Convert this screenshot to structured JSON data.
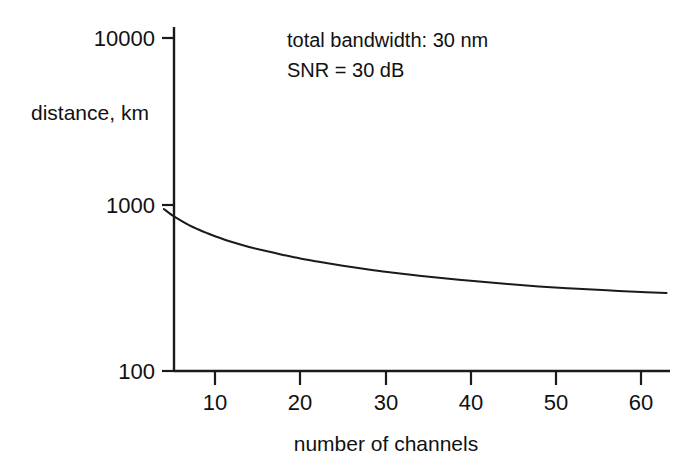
{
  "figure": {
    "background_color": "#ffffff",
    "line_color": "#1a1a1a",
    "axis_color": "#1a1a1a"
  },
  "annotations": {
    "line1": "total bandwidth: 30 nm",
    "line2": "SNR = 30 dB"
  },
  "axis_titles": {
    "y": "distance, km",
    "x": "number of channels"
  },
  "yticks": [
    {
      "label": "100",
      "value": 100
    },
    {
      "label": "1000",
      "value": 1000
    },
    {
      "label": "10000",
      "value": 10000
    }
  ],
  "xticks": [
    {
      "label": "10",
      "value": 10
    },
    {
      "label": "20",
      "value": 20
    },
    {
      "label": "30",
      "value": 30
    },
    {
      "label": "40",
      "value": 40
    },
    {
      "label": "50",
      "value": 50
    },
    {
      "label": "60",
      "value": 60
    }
  ],
  "chart_data": {
    "type": "line",
    "title": "",
    "subtitle": "",
    "xlabel": "number of channels",
    "ylabel": "distance, km",
    "xscale": "linear",
    "yscale": "log",
    "xlim": [
      4,
      63
    ],
    "ylim": [
      100,
      10000
    ],
    "grid": false,
    "legend": null,
    "annotations": [
      "total bandwidth: 30 nm",
      "SNR = 30 dB"
    ],
    "series": [
      {
        "name": "transmission distance vs number of channels",
        "x": [
          4,
          5,
          6,
          7,
          8,
          9,
          10,
          12,
          14,
          16,
          18,
          20,
          22,
          25,
          28,
          30,
          33,
          36,
          40,
          44,
          48,
          52,
          56,
          60,
          63
        ],
        "y": [
          940,
          860,
          800,
          750,
          710,
          675,
          645,
          595,
          556,
          525,
          498,
          474,
          455,
          429,
          407,
          395,
          378,
          364,
          348,
          334,
          322,
          313,
          305,
          298,
          294
        ]
      }
    ]
  }
}
